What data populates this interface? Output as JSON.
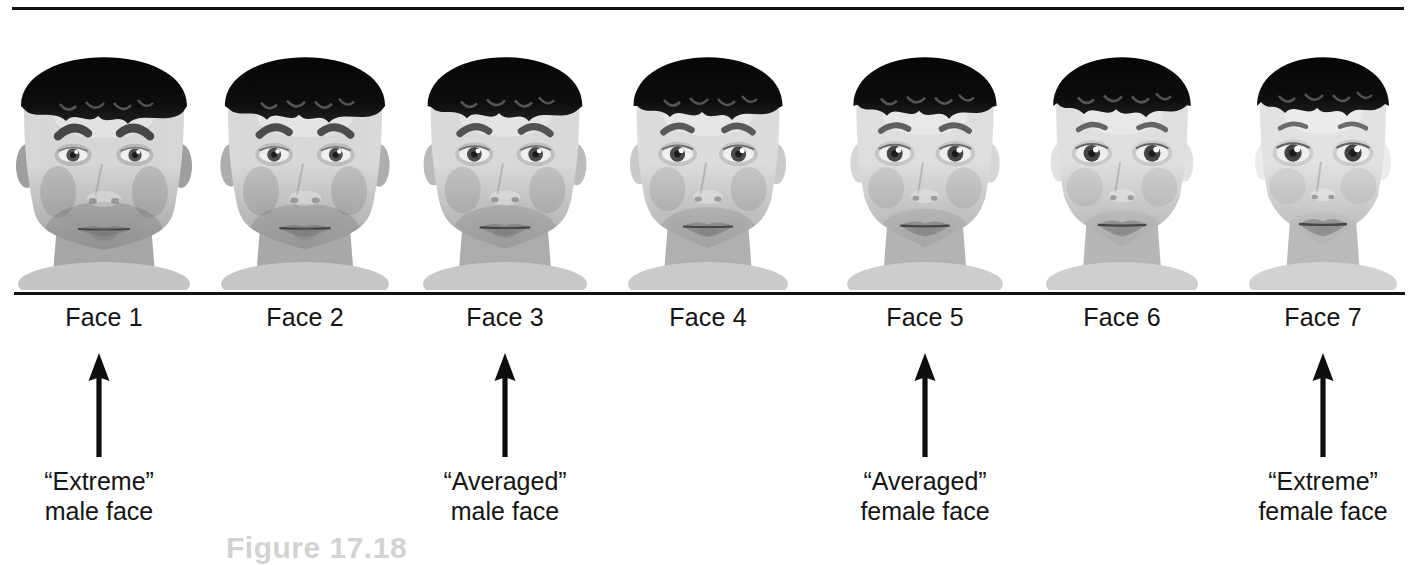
{
  "figure": {
    "number_label": "Figure 17.18",
    "rule_color": "#111111",
    "background": "#ffffff",
    "text_color": "#141414"
  },
  "faces": [
    {
      "id": 1,
      "label": "Face 1",
      "gender_morph": 0.0,
      "center_x": 104
    },
    {
      "id": 2,
      "label": "Face 2",
      "gender_morph": 0.17,
      "center_x": 305
    },
    {
      "id": 3,
      "label": "Face 3",
      "gender_morph": 0.33,
      "center_x": 505
    },
    {
      "id": 4,
      "label": "Face 4",
      "gender_morph": 0.5,
      "center_x": 708
    },
    {
      "id": 5,
      "label": "Face 5",
      "gender_morph": 0.67,
      "center_x": 925
    },
    {
      "id": 6,
      "label": "Face 6",
      "gender_morph": 0.83,
      "center_x": 1122
    },
    {
      "id": 7,
      "label": "Face 7",
      "gender_morph": 1.0,
      "center_x": 1323
    }
  ],
  "annotations": [
    {
      "target_face": 1,
      "arrow_x": 99,
      "line1": "“Extreme”",
      "line2": "male face"
    },
    {
      "target_face": 3,
      "arrow_x": 505,
      "line1": "“Averaged”",
      "line2": "male face"
    },
    {
      "target_face": 5,
      "arrow_x": 925,
      "line1": "“Averaged”",
      "line2": "female face"
    },
    {
      "target_face": 7,
      "arrow_x": 1323,
      "line1": "“Extreme”",
      "line2": "female face"
    }
  ]
}
